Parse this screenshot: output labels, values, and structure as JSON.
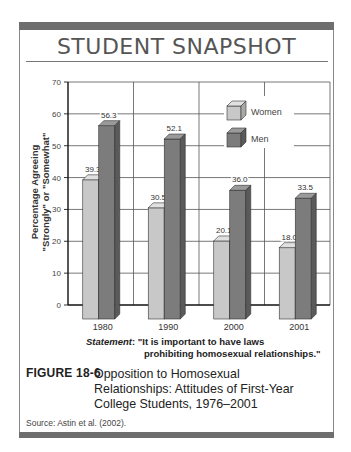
{
  "header": {
    "title": "STUDENT SNAPSHOT"
  },
  "chart_data": {
    "type": "bar",
    "title": "Opposition to Homosexual Relationships: Attitudes of First-Year College Students, 1976–2001",
    "xlabel": "",
    "ylabel": "Percentage Agreeing \"Strongly\" or \"Somewhat\"",
    "ylim": [
      0,
      70
    ],
    "yticks": [
      0,
      10,
      20,
      30,
      40,
      50,
      60,
      70
    ],
    "grid": true,
    "legend_position": "upper right (inside plot)",
    "categories": [
      "1980",
      "1990",
      "2000",
      "2001"
    ],
    "series": [
      {
        "name": "Women",
        "values": [
          39.3,
          30.5,
          20.1,
          18.0
        ],
        "color": "#c4c4c4"
      },
      {
        "name": "Men",
        "values": [
          56.3,
          52.1,
          36.0,
          33.5
        ],
        "color": "#7a7a7a"
      }
    ],
    "data_labels": {
      "Women": [
        "39.3",
        "30.5",
        "20.1",
        "18.0"
      ],
      "Men": [
        "56.3",
        "52.1",
        "36.0",
        "33.5"
      ]
    }
  },
  "chart": {
    "ylabel_line1": "Percentage Agreeing",
    "ylabel_line2": "\"Strongly\" or \"Somewhat\"",
    "legend": {
      "women": "Women",
      "men": "Men"
    }
  },
  "statement": {
    "label": "Statement",
    "line1": ": \"It is important to have laws",
    "line2": "prohibiting homosexual relationships.\""
  },
  "figure": {
    "number": "FIGURE 18-6",
    "caption": "Opposition to Homosexual Relationships: Attitudes of First-Year College Students, 1976–2001"
  },
  "source": "Source: Astin et al. (2002)."
}
